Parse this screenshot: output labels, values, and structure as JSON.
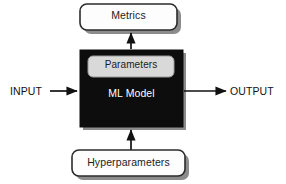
{
  "diagram": {
    "type": "block-diagram",
    "colors": {
      "background": "#ffffff",
      "model_fill": "#0d0d0d",
      "model_text": "#ffffff",
      "box_fill": "#fdfdfd",
      "box_stroke": "#2b2b2b",
      "parameters_fill": "#d9d9d9",
      "parameters_stroke": "#9a9a9a",
      "shadow": "#8c8c8c",
      "arrow": "#111111",
      "label_text": "#111111"
    },
    "nodes": [
      {
        "id": "metrics",
        "label": "Metrics",
        "shape": "rounded-rect",
        "fill": "#fdfdfd",
        "text_color": "#1c1c1c",
        "x": 80,
        "y": 4,
        "width": 97,
        "height": 26
      },
      {
        "id": "ml-model",
        "label": "ML Model",
        "shape": "rect",
        "fill": "#0d0d0d",
        "text_color": "#ffffff",
        "x": 80,
        "y": 50,
        "width": 103,
        "height": 77
      },
      {
        "id": "parameters",
        "label": "Parameters",
        "shape": "rounded-rect",
        "fill": "#d9d9d9",
        "text_color": "#1c1c1c",
        "x": 88,
        "y": 56,
        "width": 86,
        "height": 21
      },
      {
        "id": "hyperparameters",
        "label": "Hyperparameters",
        "shape": "rounded-rect",
        "fill": "#fdfdfd",
        "text_color": "#1c1c1c",
        "x": 72,
        "y": 150,
        "width": 113,
        "height": 26
      }
    ],
    "edges": [
      {
        "id": "input-to-model",
        "label": "INPUT",
        "from": "input-label",
        "to": "ml-model",
        "direction": "right",
        "arrowhead": "filled-triangle"
      },
      {
        "id": "model-to-output",
        "label": "OUTPUT",
        "from": "ml-model",
        "to": "output-label",
        "direction": "right",
        "arrowhead": "filled-triangle"
      },
      {
        "id": "model-to-metrics",
        "label": "",
        "from": "ml-model",
        "to": "metrics",
        "direction": "up",
        "arrowhead": "filled-triangle"
      },
      {
        "id": "hyperparameters-to-model",
        "label": "",
        "from": "hyperparameters",
        "to": "ml-model",
        "direction": "up",
        "arrowhead": "filled-triangle"
      }
    ],
    "labels": {
      "input": "INPUT",
      "output": "OUTPUT"
    }
  }
}
